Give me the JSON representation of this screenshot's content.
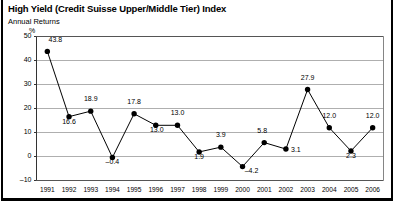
{
  "header": {
    "title": "High Yield (Credit Suisse Upper/Middle Tier) Index",
    "subtitle": "Annual Returns",
    "unit": "%"
  },
  "chart_data": {
    "type": "line",
    "title": "High Yield (Credit Suisse Upper/Middle Tier) Index",
    "subtitle": "Annual Returns",
    "xlabel": "",
    "ylabel": "%",
    "ylim": [
      -10,
      50
    ],
    "yticks": [
      -10,
      0,
      10,
      20,
      30,
      40,
      50
    ],
    "ytick_labels": [
      "–10",
      "0",
      "10",
      "20",
      "30",
      "40",
      "50"
    ],
    "grid": true,
    "grid_axis": "y",
    "legend": false,
    "marker": "filled-circle",
    "series_color": "#000000",
    "categories": [
      "1991",
      "1992",
      "1993",
      "1994",
      "1995",
      "1996",
      "1997",
      "1998",
      "1999",
      "2000",
      "2001",
      "2002",
      "2003",
      "2004",
      "2005",
      "2006"
    ],
    "values": [
      43.8,
      16.6,
      18.9,
      -0.4,
      17.8,
      13.0,
      13.0,
      1.9,
      3.9,
      -4.2,
      5.8,
      3.1,
      27.9,
      12.0,
      2.3,
      12.0
    ],
    "data_labels": [
      "43.8",
      "16.6",
      "18.9",
      "–0.4",
      "17.8",
      "13.0",
      "13.0",
      "1.9",
      "3.9",
      "–4.2",
      "5.8",
      "3.1",
      "27.9",
      "12.0",
      "2.3",
      "12.0"
    ]
  }
}
